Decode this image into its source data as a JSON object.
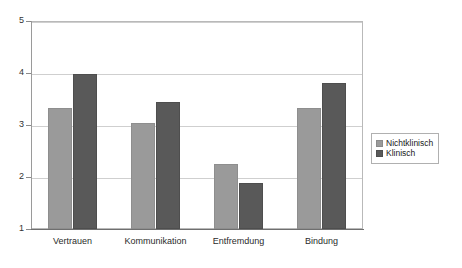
{
  "chart_data": {
    "type": "bar",
    "title": "",
    "subtitle": "",
    "xlabel": "",
    "ylabel": "",
    "categories": [
      "Vertrauen",
      "Kommunikation",
      "Entfremdung",
      "Bindung"
    ],
    "series": [
      {
        "name": "Nichtklinisch",
        "color": "#9a9a9a",
        "values": [
          3.32,
          3.04,
          2.25,
          3.32
        ]
      },
      {
        "name": "Klinisch",
        "color": "#595959",
        "values": [
          3.98,
          3.45,
          1.89,
          3.8
        ]
      }
    ],
    "ylim": [
      1,
      5
    ],
    "yticks": [
      "5",
      "4",
      "3",
      "2",
      "1"
    ],
    "ytick_values": [
      5,
      4,
      3,
      2,
      1
    ],
    "grid": true,
    "legend_position": "right"
  },
  "legend": {
    "items": [
      {
        "label": "Nichtklinisch",
        "swatch": "light-gray-swatch"
      },
      {
        "label": "Klinisch",
        "swatch": "dark-gray-swatch"
      }
    ]
  }
}
